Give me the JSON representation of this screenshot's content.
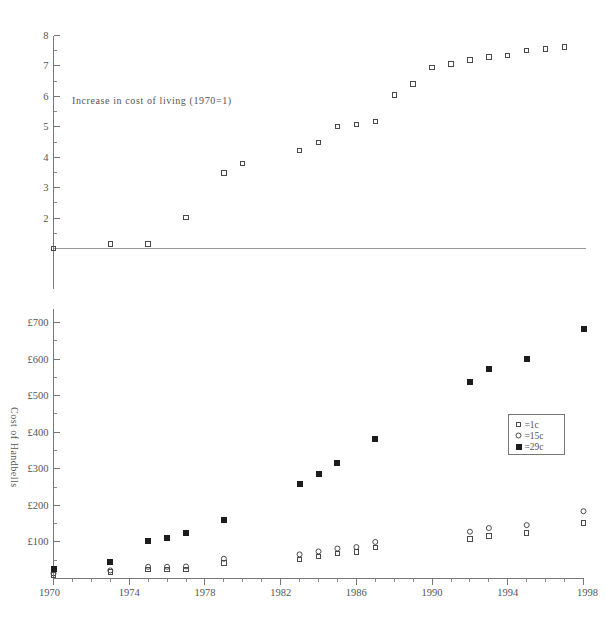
{
  "chart_data": {
    "type": "scatter",
    "title": "",
    "annotation": "Increase in cost of living (1970=1)",
    "xlabel": "",
    "ylabel": "Cost of Handbells",
    "xlim": [
      1970,
      1998
    ],
    "x_ticks": [
      "1970",
      "1974",
      "1978",
      "1982",
      "1986",
      "1990",
      "1994",
      "1998"
    ],
    "x_tick_values": [
      1970,
      1974,
      1978,
      1982,
      1986,
      1990,
      1994,
      1998
    ],
    "x_minor_step": 1,
    "grid": false,
    "legend_position": "middle-right",
    "legend": [
      {
        "marker": "open-square",
        "label": "=1c"
      },
      {
        "marker": "open-circle",
        "label": "=15c"
      },
      {
        "marker": "filled-square",
        "label": "=29c"
      }
    ],
    "panels": [
      {
        "name": "cost-of-living-panel",
        "ylabel": "",
        "ylim": [
          1,
          8
        ],
        "y_ticks": [
          "2",
          "3",
          "4",
          "5",
          "6",
          "7",
          "8"
        ],
        "y_tick_values": [
          2,
          3,
          4,
          5,
          6,
          7,
          8
        ],
        "y_minor_step": 0.5,
        "baseline_value": 1,
        "series": [
          {
            "name": "Increase in cost of living (1970=1)",
            "marker": "open-square",
            "points": [
              {
                "x": 1970,
                "y": 1.0
              },
              {
                "x": 1973,
                "y": 1.15
              },
              {
                "x": 1975,
                "y": 1.15
              },
              {
                "x": 1977,
                "y": 2.02
              },
              {
                "x": 1979,
                "y": 3.48
              },
              {
                "x": 1980,
                "y": 3.8
              },
              {
                "x": 1983,
                "y": 4.22
              },
              {
                "x": 1984,
                "y": 4.48
              },
              {
                "x": 1985,
                "y": 5.0
              },
              {
                "x": 1986,
                "y": 5.08
              },
              {
                "x": 1987,
                "y": 5.18
              },
              {
                "x": 1988,
                "y": 6.05
              },
              {
                "x": 1989,
                "y": 6.4
              },
              {
                "x": 1990,
                "y": 6.95
              },
              {
                "x": 1991,
                "y": 7.07
              },
              {
                "x": 1992,
                "y": 7.2
              },
              {
                "x": 1993,
                "y": 7.3
              },
              {
                "x": 1994,
                "y": 7.35
              },
              {
                "x": 1995,
                "y": 7.5
              },
              {
                "x": 1996,
                "y": 7.55
              },
              {
                "x": 1997,
                "y": 7.62
              }
            ]
          }
        ]
      },
      {
        "name": "cost-of-handbells-panel",
        "ylabel": "Cost of Handbells",
        "ylim": [
          0,
          730
        ],
        "y_ticks": [
          "£100",
          "£200",
          "£300",
          "£400",
          "£500",
          "£600",
          "£700"
        ],
        "y_tick_values": [
          100,
          200,
          300,
          400,
          500,
          600,
          700
        ],
        "y_minor_step": 50,
        "series": [
          {
            "name": "=1c",
            "marker": "open-square",
            "points": [
              {
                "x": 1970,
                "y": 10
              },
              {
                "x": 1973,
                "y": 18
              },
              {
                "x": 1975,
                "y": 24
              },
              {
                "x": 1976,
                "y": 24
              },
              {
                "x": 1977,
                "y": 24
              },
              {
                "x": 1979,
                "y": 42
              },
              {
                "x": 1983,
                "y": 52
              },
              {
                "x": 1984,
                "y": 60
              },
              {
                "x": 1985,
                "y": 68
              },
              {
                "x": 1986,
                "y": 72
              },
              {
                "x": 1987,
                "y": 84
              },
              {
                "x": 1992,
                "y": 108
              },
              {
                "x": 1993,
                "y": 116
              },
              {
                "x": 1995,
                "y": 124
              },
              {
                "x": 1998,
                "y": 152
              }
            ]
          },
          {
            "name": "=15c",
            "marker": "open-circle",
            "points": [
              {
                "x": 1970,
                "y": 14
              },
              {
                "x": 1973,
                "y": 22
              },
              {
                "x": 1975,
                "y": 32
              },
              {
                "x": 1976,
                "y": 32
              },
              {
                "x": 1977,
                "y": 33
              },
              {
                "x": 1979,
                "y": 54
              },
              {
                "x": 1983,
                "y": 66
              },
              {
                "x": 1984,
                "y": 74
              },
              {
                "x": 1985,
                "y": 82
              },
              {
                "x": 1986,
                "y": 86
              },
              {
                "x": 1987,
                "y": 100
              },
              {
                "x": 1992,
                "y": 128
              },
              {
                "x": 1993,
                "y": 138
              },
              {
                "x": 1995,
                "y": 146
              },
              {
                "x": 1998,
                "y": 184
              }
            ]
          },
          {
            "name": "=29c",
            "marker": "filled-square",
            "points": [
              {
                "x": 1970,
                "y": 26
              },
              {
                "x": 1973,
                "y": 44
              },
              {
                "x": 1975,
                "y": 102
              },
              {
                "x": 1976,
                "y": 110
              },
              {
                "x": 1977,
                "y": 124
              },
              {
                "x": 1979,
                "y": 160
              },
              {
                "x": 1983,
                "y": 258
              },
              {
                "x": 1984,
                "y": 286
              },
              {
                "x": 1985,
                "y": 315
              },
              {
                "x": 1987,
                "y": 382
              },
              {
                "x": 1992,
                "y": 538
              },
              {
                "x": 1993,
                "y": 572
              },
              {
                "x": 1995,
                "y": 600
              },
              {
                "x": 1998,
                "y": 682
              }
            ]
          }
        ]
      }
    ]
  }
}
